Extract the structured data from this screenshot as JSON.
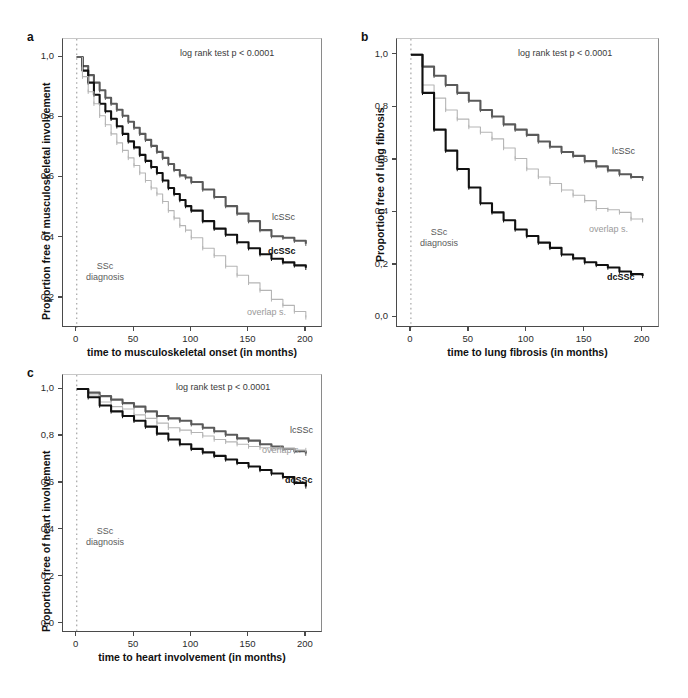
{
  "figure": {
    "type": "kaplan-meier-survival-panel",
    "panels": [
      "a",
      "b",
      "c"
    ]
  },
  "panel_a": {
    "letter": "a",
    "stat_annotation": "log rank test p < 0.0001",
    "diagnosis_annotation_line1": "SSc",
    "diagnosis_annotation_line2": "diagnosis",
    "chart_data": {
      "type": "line",
      "title": "",
      "xlabel": "time to musculoskeletal onset (in months)",
      "ylabel": "Proportion free of musculoskeletal involvement",
      "xlim": [
        -12,
        215
      ],
      "ylim": [
        0.1,
        1.06
      ],
      "xticks": [
        0,
        50,
        100,
        150,
        200
      ],
      "xtick_labels": [
        "0",
        "50",
        "100",
        "150",
        "200"
      ],
      "yticks": [
        0.2,
        0.4,
        0.6,
        0.8,
        1.0
      ],
      "ytick_labels": [
        "0,2",
        "0,4",
        "0,6",
        "0,8",
        "1,0"
      ],
      "grid": false,
      "legend_position": "inline-right",
      "series": [
        {
          "name": "lcSSc",
          "color": "#5a5a5a",
          "label": "lcSSc",
          "x": [
            0,
            5,
            10,
            15,
            20,
            25,
            30,
            35,
            40,
            45,
            50,
            55,
            60,
            65,
            70,
            75,
            80,
            85,
            90,
            95,
            100,
            110,
            120,
            130,
            140,
            150,
            160,
            170,
            180,
            190,
            200
          ],
          "y": [
            1.0,
            0.97,
            0.94,
            0.915,
            0.89,
            0.865,
            0.845,
            0.825,
            0.805,
            0.785,
            0.765,
            0.745,
            0.725,
            0.705,
            0.685,
            0.665,
            0.645,
            0.625,
            0.607,
            0.6,
            0.585,
            0.56,
            0.535,
            0.505,
            0.48,
            0.455,
            0.425,
            0.405,
            0.4,
            0.39,
            0.38
          ]
        },
        {
          "name": "dcSSc",
          "color": "#111111",
          "label": "dcSSc",
          "x": [
            0,
            5,
            10,
            15,
            20,
            25,
            30,
            35,
            40,
            45,
            50,
            55,
            60,
            65,
            70,
            75,
            80,
            85,
            90,
            95,
            100,
            110,
            120,
            130,
            140,
            150,
            160,
            170,
            180,
            190,
            200
          ],
          "y": [
            1.0,
            0.955,
            0.915,
            0.875,
            0.845,
            0.82,
            0.795,
            0.77,
            0.745,
            0.72,
            0.7,
            0.675,
            0.655,
            0.635,
            0.615,
            0.59,
            0.565,
            0.545,
            0.525,
            0.505,
            0.49,
            0.455,
            0.43,
            0.41,
            0.385,
            0.365,
            0.345,
            0.33,
            0.318,
            0.308,
            0.3
          ]
        },
        {
          "name": "overlap s.",
          "color": "#b5b5b5",
          "label": "overlap s.",
          "x": [
            0,
            5,
            10,
            15,
            20,
            25,
            30,
            35,
            40,
            45,
            50,
            55,
            60,
            65,
            70,
            75,
            80,
            85,
            90,
            95,
            100,
            110,
            120,
            130,
            140,
            150,
            160,
            170,
            180,
            190,
            200
          ],
          "y": [
            1.0,
            0.935,
            0.885,
            0.845,
            0.805,
            0.775,
            0.745,
            0.715,
            0.69,
            0.665,
            0.64,
            0.615,
            0.59,
            0.565,
            0.545,
            0.52,
            0.49,
            0.465,
            0.44,
            0.425,
            0.4,
            0.365,
            0.34,
            0.305,
            0.275,
            0.25,
            0.225,
            0.195,
            0.175,
            0.155,
            0.135
          ]
        }
      ]
    }
  },
  "panel_b": {
    "letter": "b",
    "stat_annotation": "log rank test p < 0.0001",
    "diagnosis_annotation_line1": "SSc",
    "diagnosis_annotation_line2": "diagnosis",
    "chart_data": {
      "type": "line",
      "title": "",
      "xlabel": "time to lung fibrosis (in months)",
      "ylabel": "Proportion free of lung fibrosis",
      "xlim": [
        -12,
        215
      ],
      "ylim": [
        -0.04,
        1.06
      ],
      "xticks": [
        0,
        50,
        100,
        150,
        200
      ],
      "xtick_labels": [
        "0",
        "50",
        "100",
        "150",
        "200"
      ],
      "yticks": [
        0.0,
        0.2,
        0.4,
        0.6,
        0.8,
        1.0
      ],
      "ytick_labels": [
        "0,0",
        "0,2",
        "0,4",
        "0,6",
        "0,8",
        "1,0"
      ],
      "grid": false,
      "legend_position": "inline-right",
      "series": [
        {
          "name": "lcSSc",
          "color": "#5a5a5a",
          "label": "lcSSc",
          "x": [
            0,
            10,
            20,
            30,
            40,
            50,
            60,
            70,
            80,
            90,
            100,
            110,
            120,
            130,
            140,
            150,
            160,
            170,
            180,
            190,
            200
          ],
          "y": [
            1.0,
            0.955,
            0.92,
            0.885,
            0.855,
            0.825,
            0.79,
            0.765,
            0.735,
            0.715,
            0.695,
            0.67,
            0.65,
            0.63,
            0.615,
            0.595,
            0.575,
            0.56,
            0.545,
            0.535,
            0.528
          ]
        },
        {
          "name": "overlap s.",
          "color": "#b5b5b5",
          "label": "overlap s.",
          "x": [
            0,
            10,
            20,
            30,
            40,
            50,
            60,
            70,
            80,
            90,
            100,
            110,
            120,
            130,
            140,
            150,
            160,
            170,
            180,
            190,
            200
          ],
          "y": [
            1.0,
            0.885,
            0.835,
            0.79,
            0.755,
            0.725,
            0.705,
            0.68,
            0.645,
            0.605,
            0.565,
            0.535,
            0.51,
            0.485,
            0.465,
            0.445,
            0.415,
            0.41,
            0.4,
            0.375,
            0.37
          ]
        },
        {
          "name": "dcSSc",
          "color": "#111111",
          "label": "dcSSc",
          "x": [
            0,
            10,
            20,
            30,
            40,
            50,
            60,
            70,
            80,
            90,
            100,
            110,
            120,
            130,
            140,
            150,
            160,
            170,
            180,
            190,
            200
          ],
          "y": [
            1.0,
            0.855,
            0.715,
            0.635,
            0.565,
            0.495,
            0.435,
            0.4,
            0.37,
            0.335,
            0.31,
            0.285,
            0.265,
            0.24,
            0.225,
            0.21,
            0.2,
            0.19,
            0.175,
            0.165,
            0.158
          ]
        }
      ]
    }
  },
  "panel_c": {
    "letter": "c",
    "stat_annotation": "log rank test p < 0.0001",
    "diagnosis_annotation_line1": "SSc",
    "diagnosis_annotation_line2": "diagnosis",
    "chart_data": {
      "type": "line",
      "title": "",
      "xlabel": "time to heart involvement (in months)",
      "ylabel": "Proportion free of heart involvement",
      "xlim": [
        -12,
        215
      ],
      "ylim": [
        -0.04,
        1.06
      ],
      "xticks": [
        0,
        50,
        100,
        150,
        200
      ],
      "xtick_labels": [
        "0",
        "50",
        "100",
        "150",
        "200"
      ],
      "yticks": [
        0.0,
        0.2,
        0.4,
        0.6,
        0.8,
        1.0
      ],
      "ytick_labels": [
        "0,0",
        "0,2",
        "0,4",
        "0,6",
        "0,8",
        "1,0"
      ],
      "grid": false,
      "legend_position": "inline-right",
      "series": [
        {
          "name": "lcSSc",
          "color": "#5a5a5a",
          "label": "lcSSc",
          "x": [
            0,
            10,
            20,
            30,
            40,
            50,
            60,
            70,
            80,
            90,
            100,
            110,
            120,
            130,
            140,
            150,
            160,
            170,
            180,
            190,
            200
          ],
          "y": [
            1.0,
            0.985,
            0.97,
            0.955,
            0.94,
            0.925,
            0.905,
            0.885,
            0.875,
            0.865,
            0.85,
            0.835,
            0.82,
            0.805,
            0.79,
            0.78,
            0.765,
            0.755,
            0.745,
            0.735,
            0.725
          ]
        },
        {
          "name": "overlap s.",
          "color": "#b5b5b5",
          "label": "overlap s.",
          "x": [
            0,
            10,
            20,
            30,
            40,
            50,
            60,
            70,
            80,
            90,
            100,
            110,
            120,
            130,
            140,
            150,
            160,
            170,
            180,
            190,
            200
          ],
          "y": [
            1.0,
            0.975,
            0.945,
            0.925,
            0.915,
            0.89,
            0.875,
            0.855,
            0.835,
            0.825,
            0.815,
            0.8,
            0.785,
            0.775,
            0.765,
            0.755,
            0.75,
            0.745,
            0.745,
            0.74,
            0.74
          ]
        },
        {
          "name": "dcSSc",
          "color": "#111111",
          "label": "dcSSc",
          "x": [
            0,
            10,
            20,
            30,
            40,
            50,
            60,
            70,
            80,
            90,
            100,
            110,
            120,
            130,
            140,
            150,
            160,
            170,
            180,
            190,
            200
          ],
          "y": [
            1.0,
            0.965,
            0.93,
            0.905,
            0.885,
            0.865,
            0.84,
            0.81,
            0.785,
            0.765,
            0.745,
            0.73,
            0.715,
            0.7,
            0.685,
            0.67,
            0.655,
            0.64,
            0.625,
            0.6,
            0.585
          ]
        }
      ]
    }
  }
}
